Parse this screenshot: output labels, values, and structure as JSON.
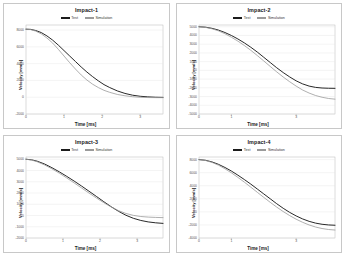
{
  "figure": {
    "background": "#ffffff",
    "border_color": "#c8c8c8",
    "series_colors": {
      "test": "#1c1c1c",
      "simulation": "#9a9a9a"
    },
    "legend": {
      "test_label": "Test",
      "simulation_label": "Simulation"
    },
    "axis_titles": {
      "x": "Time [ms]",
      "y": "Velocity [mm/s]"
    }
  },
  "charts": [
    {
      "id": "impact-1",
      "title": "Impact-1",
      "xlabel": "Time [ms]",
      "ylabel": "Velocity [mm/s]",
      "xticks": [
        "0",
        "1",
        "2",
        "3"
      ],
      "xtick_values": [
        0,
        1,
        2,
        3
      ],
      "yticks": [
        "8000",
        "6000",
        "4000",
        "2000",
        "0",
        "-2000"
      ],
      "ytick_values": [
        8000,
        6000,
        4000,
        2000,
        0,
        -2000
      ],
      "xlim": [
        0,
        3.6
      ],
      "ylim": [
        -2000,
        8600
      ],
      "grid": true,
      "series": [
        {
          "name": "Test",
          "color": "#1c1c1c",
          "x": [
            0,
            0.12,
            0.25,
            0.4,
            0.55,
            0.7,
            0.85,
            1.0,
            1.15,
            1.3,
            1.45,
            1.6,
            1.75,
            1.9,
            2.05,
            2.2,
            2.4,
            2.6,
            2.8,
            3.0,
            3.2,
            3.4,
            3.6
          ],
          "y": [
            8100,
            8080,
            7950,
            7700,
            7300,
            6800,
            6200,
            5550,
            4900,
            4250,
            3600,
            3000,
            2450,
            1950,
            1500,
            1150,
            750,
            450,
            240,
            110,
            40,
            0,
            -20
          ]
        },
        {
          "name": "Simulation",
          "color": "#9a9a9a",
          "x": [
            0,
            0.12,
            0.25,
            0.4,
            0.55,
            0.7,
            0.85,
            1.0,
            1.15,
            1.3,
            1.45,
            1.6,
            1.75,
            1.9,
            2.05,
            2.2,
            2.4,
            2.6,
            2.8,
            3.0,
            3.2,
            3.4,
            3.6
          ],
          "y": [
            8100,
            8060,
            7880,
            7550,
            7050,
            6450,
            5700,
            4900,
            4100,
            3350,
            2650,
            2050,
            1550,
            1150,
            820,
            580,
            330,
            170,
            60,
            -10,
            -40,
            -50,
            -50
          ]
        }
      ]
    },
    {
      "id": "impact-2",
      "title": "Impact-2",
      "xlabel": "Time [ms]",
      "ylabel": "Velocity [mm/s]",
      "xticks": [
        "0",
        "1",
        "3"
      ],
      "xtick_values": [
        0,
        1,
        3
      ],
      "yticks": [
        "5000",
        "4000",
        "3000",
        "2000",
        "1000",
        "0",
        "-1000",
        "-2000",
        "-3000",
        "-4000",
        "-5000"
      ],
      "ytick_values": [
        5000,
        4000,
        3000,
        2000,
        1000,
        0,
        -1000,
        -2000,
        -3000,
        -4000,
        -5000
      ],
      "xlim": [
        0,
        4.2
      ],
      "ylim": [
        -5000,
        5200
      ],
      "grid": true,
      "series": [
        {
          "name": "Test",
          "color": "#1c1c1c",
          "x": [
            0,
            0.2,
            0.4,
            0.6,
            0.8,
            1.0,
            1.2,
            1.4,
            1.6,
            1.8,
            2.0,
            2.2,
            2.4,
            2.6,
            2.8,
            3.0,
            3.2,
            3.4,
            3.6,
            3.8,
            4.0,
            4.2
          ],
          "y": [
            5000,
            4950,
            4820,
            4620,
            4340,
            4000,
            3600,
            3150,
            2650,
            2100,
            1500,
            900,
            300,
            -250,
            -750,
            -1200,
            -1550,
            -1800,
            -1950,
            -2020,
            -2050,
            -2060
          ]
        },
        {
          "name": "Simulation",
          "color": "#9a9a9a",
          "x": [
            0,
            0.2,
            0.4,
            0.6,
            0.8,
            1.0,
            1.2,
            1.4,
            1.6,
            1.8,
            2.0,
            2.2,
            2.4,
            2.6,
            2.8,
            3.0,
            3.2,
            3.4,
            3.6,
            3.8,
            4.0,
            4.2
          ],
          "y": [
            5000,
            4930,
            4770,
            4530,
            4200,
            3800,
            3350,
            2850,
            2300,
            1700,
            1080,
            450,
            -170,
            -760,
            -1300,
            -1800,
            -2250,
            -2600,
            -2880,
            -3080,
            -3220,
            -3300
          ]
        }
      ]
    },
    {
      "id": "impact-3",
      "title": "Impact-3",
      "xlabel": "Time [ms]",
      "ylabel": "Velocity [mm/s]",
      "xticks": [
        "0",
        "1",
        "2",
        "3"
      ],
      "xtick_values": [
        0,
        1,
        2,
        3
      ],
      "yticks": [
        "5000",
        "4000",
        "3000",
        "2000",
        "1000",
        "0",
        "-1000",
        "-2000"
      ],
      "ytick_values": [
        5000,
        4000,
        3000,
        2000,
        1000,
        0,
        -1000,
        -2000
      ],
      "xlim": [
        0,
        3.7
      ],
      "ylim": [
        -2000,
        5200
      ],
      "grid": true,
      "series": [
        {
          "name": "Test",
          "color": "#1c1c1c",
          "x": [
            0,
            0.15,
            0.3,
            0.5,
            0.7,
            0.9,
            1.1,
            1.3,
            1.5,
            1.7,
            1.9,
            2.1,
            2.3,
            2.5,
            2.7,
            2.9,
            3.1,
            3.3,
            3.5,
            3.7
          ],
          "y": [
            5000,
            4950,
            4830,
            4580,
            4250,
            3880,
            3480,
            3060,
            2620,
            2160,
            1700,
            1230,
            780,
            370,
            20,
            -250,
            -440,
            -570,
            -650,
            -700
          ]
        },
        {
          "name": "Simulation",
          "color": "#9a9a9a",
          "x": [
            0,
            0.15,
            0.3,
            0.5,
            0.7,
            0.9,
            1.1,
            1.3,
            1.5,
            1.7,
            1.9,
            2.1,
            2.3,
            2.5,
            2.7,
            2.9,
            3.1,
            3.3,
            3.5,
            3.7
          ],
          "y": [
            5000,
            4930,
            4780,
            4500,
            4150,
            3760,
            3340,
            2900,
            2450,
            2000,
            1560,
            1140,
            760,
            430,
            180,
            10,
            -90,
            -140,
            -170,
            -190
          ]
        }
      ]
    },
    {
      "id": "impact-4",
      "title": "Impact-4",
      "xlabel": "Time [ms]",
      "ylabel": "Velocity [mm/s]",
      "xticks": [
        "0",
        "1",
        "3"
      ],
      "xtick_values": [
        0,
        1,
        3
      ],
      "yticks": [
        "8000",
        "6000",
        "4000",
        "2000",
        "0",
        "-2000",
        "-4000"
      ],
      "ytick_values": [
        8000,
        6000,
        4000,
        2000,
        0,
        -2000,
        -4000
      ],
      "xlim": [
        0,
        4.2
      ],
      "ylim": [
        -4000,
        8400
      ],
      "grid": true,
      "series": [
        {
          "name": "Test",
          "color": "#1c1c1c",
          "x": [
            0,
            0.2,
            0.4,
            0.6,
            0.8,
            1.0,
            1.2,
            1.4,
            1.6,
            1.8,
            2.0,
            2.2,
            2.4,
            2.6,
            2.8,
            3.0,
            3.2,
            3.4,
            3.6,
            3.8,
            4.0,
            4.2
          ],
          "y": [
            8000,
            7900,
            7650,
            7280,
            6800,
            6250,
            5620,
            4950,
            4250,
            3500,
            2750,
            2000,
            1250,
            550,
            -80,
            -620,
            -1080,
            -1450,
            -1720,
            -1900,
            -2000,
            -2050
          ]
        },
        {
          "name": "Simulation",
          "color": "#9a9a9a",
          "x": [
            0,
            0.2,
            0.4,
            0.6,
            0.8,
            1.0,
            1.2,
            1.4,
            1.6,
            1.8,
            2.0,
            2.2,
            2.4,
            2.6,
            2.8,
            3.0,
            3.2,
            3.4,
            3.6,
            3.8,
            4.0,
            4.2
          ],
          "y": [
            8000,
            7870,
            7580,
            7150,
            6600,
            5980,
            5280,
            4550,
            3780,
            3000,
            2220,
            1460,
            730,
            50,
            -570,
            -1120,
            -1600,
            -2000,
            -2320,
            -2550,
            -2700,
            -2780
          ]
        }
      ]
    }
  ]
}
